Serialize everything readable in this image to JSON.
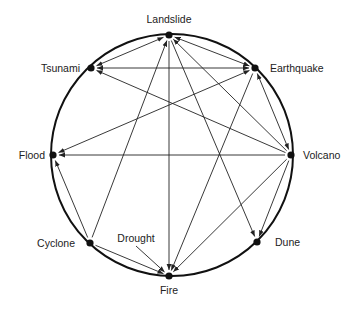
{
  "diagram": {
    "type": "circular-network",
    "circle": {
      "cx": 172,
      "cy": 155,
      "r": 121,
      "stroke": "#111111"
    },
    "colors": {
      "node": "#111111",
      "edge": "#222222",
      "text": "#222222",
      "background": "#ffffff"
    },
    "nodes": [
      {
        "id": "landslide",
        "label": "Landslide",
        "x": 169,
        "y": 35,
        "lx": 169,
        "ly": 23,
        "anchor": "middle",
        "dot": true
      },
      {
        "id": "tsunami",
        "label": "Tsunami",
        "x": 91,
        "y": 68,
        "lx": 80,
        "ly": 72,
        "anchor": "end",
        "dot": true
      },
      {
        "id": "earthquake",
        "label": "Earthquake",
        "x": 255,
        "y": 68,
        "lx": 270,
        "ly": 72,
        "anchor": "start",
        "dot": true
      },
      {
        "id": "flood",
        "label": "Flood",
        "x": 53,
        "y": 155,
        "lx": 45,
        "ly": 159,
        "anchor": "end",
        "dot": true
      },
      {
        "id": "volcano",
        "label": "Volcano",
        "x": 291,
        "y": 155,
        "lx": 303,
        "ly": 159,
        "anchor": "start",
        "dot": true
      },
      {
        "id": "cyclone",
        "label": "Cyclone",
        "x": 90,
        "y": 243,
        "lx": 75,
        "ly": 247,
        "anchor": "end",
        "dot": true
      },
      {
        "id": "drought",
        "label": "Drought",
        "x": 136,
        "y": 246,
        "lx": 136,
        "ly": 242,
        "anchor": "middle",
        "dot": false
      },
      {
        "id": "dune",
        "label": "Dune",
        "x": 257,
        "y": 242,
        "lx": 275,
        "ly": 246,
        "anchor": "start",
        "dot": true
      },
      {
        "id": "fire",
        "label": "Fire",
        "x": 169,
        "y": 276,
        "lx": 169,
        "ly": 294,
        "anchor": "middle",
        "dot": true
      }
    ],
    "edges": [
      {
        "from": "tsunami",
        "to": "landslide",
        "bidirectional": true
      },
      {
        "from": "earthquake",
        "to": "landslide",
        "bidirectional": true
      },
      {
        "from": "earthquake",
        "to": "tsunami",
        "bidirectional": true
      },
      {
        "from": "volcano",
        "to": "tsunami",
        "bidirectional": false
      },
      {
        "from": "flood",
        "to": "earthquake",
        "bidirectional": true
      },
      {
        "from": "earthquake",
        "to": "volcano",
        "bidirectional": true
      },
      {
        "from": "volcano",
        "to": "flood",
        "bidirectional": false
      },
      {
        "from": "volcano",
        "to": "landslide",
        "bidirectional": false
      },
      {
        "from": "landslide",
        "to": "dune",
        "bidirectional": false
      },
      {
        "from": "volcano",
        "to": "dune",
        "bidirectional": false
      },
      {
        "from": "volcano",
        "to": "fire",
        "bidirectional": false
      },
      {
        "from": "earthquake",
        "to": "fire",
        "bidirectional": false
      },
      {
        "from": "landslide",
        "to": "fire",
        "bidirectional": false
      },
      {
        "from": "cyclone",
        "to": "landslide",
        "bidirectional": false
      },
      {
        "from": "cyclone",
        "to": "flood",
        "bidirectional": false
      },
      {
        "from": "cyclone",
        "to": "fire",
        "bidirectional": false
      },
      {
        "from": "drought",
        "to": "fire",
        "bidirectional": false
      }
    ]
  }
}
